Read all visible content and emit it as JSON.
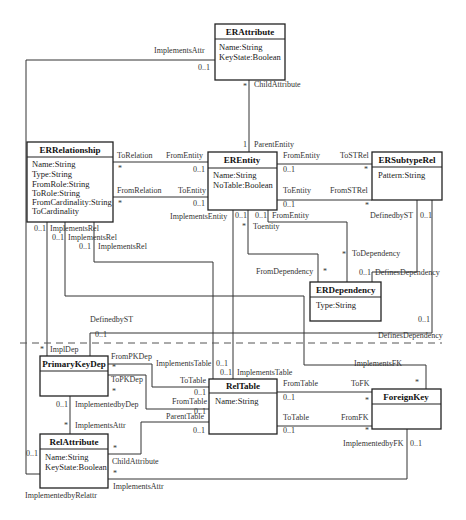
{
  "diagram": {
    "classes": {
      "erattribute": {
        "name": "ERAttribute",
        "attrs": [
          "Name:String",
          "KeyState:Boolean"
        ]
      },
      "errelationship": {
        "name": "ERRelationship",
        "attrs": [
          "Name:String",
          "Type:String",
          "FromRole:String",
          "ToRole:String",
          "FromCardinality:String",
          "ToCardinality"
        ]
      },
      "erentity": {
        "name": "EREntity",
        "attrs": [
          "Name:String",
          "NoTable:Boolean"
        ]
      },
      "ersubtyperel": {
        "name": "ERSubtypeRel",
        "attrs": [
          "Pattern:String"
        ]
      },
      "erdependency": {
        "name": "ERDependency",
        "attrs": [
          "Type:String"
        ]
      },
      "primarykeydep": {
        "name": "PrimaryKeyDep",
        "attrs": []
      },
      "reltable": {
        "name": "RelTable",
        "attrs": [
          "Name:String"
        ]
      },
      "foreignkey": {
        "name": "ForeignKey",
        "attrs": []
      },
      "relattribute": {
        "name": "RelAttribute",
        "attrs": [
          "Name:String",
          "KeyState:Boolean"
        ]
      }
    },
    "labels": {
      "implementsattr_top": "ImplementsAttr",
      "m_implementsattr_top": "0..1",
      "childattribute_top": "ChildAttribute",
      "m_childattribute_top": "*",
      "parententity": "ParentEntity",
      "m_parententity": "1",
      "torelation": "ToRelation",
      "m_torelation": "*",
      "fromentity_rel": "FromEntity",
      "m_fromentity_rel": "0..1",
      "fromrelation": "FromRelation",
      "m_fromrelation": "*",
      "toentity_rel": "ToEntity",
      "m_toentity_rel": "0..1",
      "implementsentity": "ImplementsEntity",
      "fromentity_st": "FromEntity",
      "m_fromentity_st": "0..1",
      "tostrel": "ToSTRel",
      "m_tostrel": "*",
      "toentity_st": "ToEntity",
      "m_toentity_st": "0..1",
      "fromstrel": "FromSTRel",
      "m_fromstrel": "*",
      "m_implentity": "0..1",
      "m_fromentity_dep": "0..1",
      "fromentity_dep": "FromEntity",
      "m_toentity_dep": "*",
      "toentity_dep": "Toentity",
      "definedbyst_right": "DefinedbyST",
      "m_definedbyst_right": "0..1",
      "todependency": "ToDependency",
      "m_todependency": "*",
      "fromdependency": "FromDependency",
      "m_fromdependency": "*",
      "definesdependency_a": "DefinesDependency",
      "m_definesdependency_a": "0..1",
      "definesdependency_b": "DefinesDependency",
      "m_definesdependency_b": "0..1",
      "implementsrel_1": "ImplementsRel",
      "m_implementsrel_1": "0..1",
      "implementsrel_2": "ImplementsRel",
      "m_implementsrel_2": "0..1",
      "implementsrel_3": "ImplementsRel",
      "m_implementsrel_3": "0..1",
      "definedbyst_left": "DefinedbyST",
      "m_definedbyst_left": "0..1",
      "impldep": "ImplDep",
      "m_impldep": "*",
      "frompkdep": "FromPKDep",
      "m_frompkdep": "*",
      "topkdep": "ToPKDep",
      "m_topkdep": "*",
      "implementstable_a": "ImplementsTable",
      "m_implementstable_a": "0..1",
      "implementstable_b": "ImplementsTable",
      "m_implementstable_b": "0..1",
      "totable_pk": "ToTable",
      "m_totable_pk": "0..1",
      "fromtable_pk": "FromTable",
      "m_fromtable_pk": "0..1",
      "parenttable": "ParentTable",
      "m_parenttable": "0..1",
      "implementedbydep": "ImplementedbyDep",
      "m_implementedbydep": "0..1",
      "implementsattr_pk": "ImplementsAttr",
      "m_implementsattr_pk": "*",
      "childattribute_bot": "ChildAttribute",
      "m_childattribute_bot": "*",
      "implementsattr_bot": "ImplementsAttr",
      "m_implementsattr_bot": "*",
      "implementedbyrelattr": "ImplementedbyRelattr",
      "m_implementedbyrelattr": "0..1",
      "implementsfk": "ImplementsFK",
      "m_implementsfk": "*",
      "fromtable_fk": "FromTable",
      "m_fromtable_fk": "0..1",
      "tofk": "ToFK",
      "m_tofk": "*",
      "totable_fk": "ToTable",
      "m_totable_fk": "0..1",
      "fromfk": "FromFK",
      "m_fromfk": "*",
      "implementedbyfk": "ImplementedbyFK",
      "m_implementedbyfk": "0..1"
    }
  }
}
